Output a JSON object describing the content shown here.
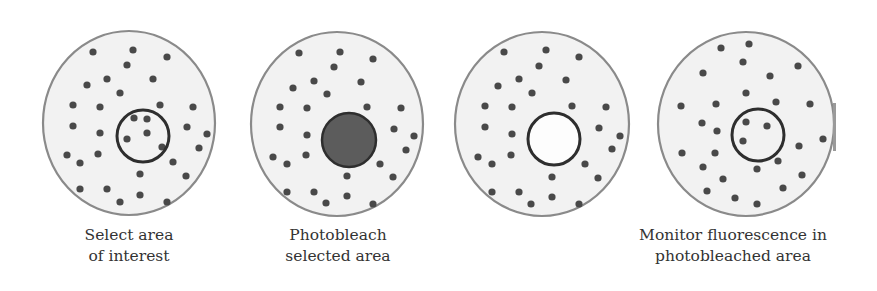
{
  "colors": {
    "cell_fill": "#f2f2f2",
    "cell_stroke": "#8a8a8a",
    "dot": "#4a4a4a",
    "roi_stroke": "#2e2e2e",
    "bleached_fill": "#5c5c5c",
    "label_text": "#333333"
  },
  "panels": [
    {
      "id": "select",
      "cell": {
        "cx": 129,
        "cy": 123,
        "rx": 86,
        "ry": 92
      },
      "roi": {
        "cx": 143,
        "cy": 136,
        "r": 26,
        "state": "outline"
      },
      "label": {
        "line1": "Select area",
        "line2": "of interest",
        "x": 129
      },
      "dots": [
        [
          93,
          52
        ],
        [
          133,
          50
        ],
        [
          167,
          57
        ],
        [
          127,
          65
        ],
        [
          107,
          79
        ],
        [
          87,
          85
        ],
        [
          153,
          79
        ],
        [
          120,
          93
        ],
        [
          73,
          105
        ],
        [
          100,
          107
        ],
        [
          160,
          105
        ],
        [
          193,
          107
        ],
        [
          73,
          126
        ],
        [
          100,
          133
        ],
        [
          187,
          127
        ],
        [
          207,
          134
        ],
        [
          67,
          155
        ],
        [
          80,
          163
        ],
        [
          98,
          154
        ],
        [
          199,
          148
        ],
        [
          173,
          162
        ],
        [
          140,
          174
        ],
        [
          186,
          176
        ],
        [
          80,
          189
        ],
        [
          107,
          189
        ],
        [
          140,
          195
        ],
        [
          120,
          202
        ],
        [
          167,
          202
        ],
        [
          134,
          118
        ],
        [
          147,
          119
        ],
        [
          147,
          133
        ],
        [
          127,
          139
        ],
        [
          162,
          147
        ]
      ]
    },
    {
      "id": "photobleach",
      "cell": {
        "cx": 337,
        "cy": 124,
        "rx": 86,
        "ry": 92
      },
      "roi": {
        "cx": 349,
        "cy": 140,
        "r": 27,
        "state": "filled"
      },
      "label": {
        "line1": "Photobleach",
        "line2": "selected area",
        "x": 338
      },
      "dots": [
        [
          299,
          53
        ],
        [
          340,
          52
        ],
        [
          373,
          59
        ],
        [
          334,
          67
        ],
        [
          314,
          81
        ],
        [
          293,
          88
        ],
        [
          361,
          82
        ],
        [
          327,
          94
        ],
        [
          280,
          107
        ],
        [
          307,
          108
        ],
        [
          367,
          107
        ],
        [
          401,
          108
        ],
        [
          280,
          127
        ],
        [
          307,
          135
        ],
        [
          394,
          129
        ],
        [
          414,
          136
        ],
        [
          273,
          157
        ],
        [
          287,
          164
        ],
        [
          306,
          155
        ],
        [
          406,
          150
        ],
        [
          380,
          164
        ],
        [
          347,
          176
        ],
        [
          393,
          177
        ],
        [
          287,
          192
        ],
        [
          314,
          192
        ],
        [
          347,
          196
        ],
        [
          326,
          203
        ],
        [
          373,
          204
        ]
      ]
    },
    {
      "id": "bleached",
      "cell": {
        "cx": 542,
        "cy": 124,
        "rx": 87,
        "ry": 92
      },
      "roi": {
        "cx": 554,
        "cy": 139,
        "r": 26,
        "state": "empty"
      },
      "label": {
        "line1": "",
        "line2": "",
        "x": 542
      },
      "dots": [
        [
          504,
          52
        ],
        [
          546,
          50
        ],
        [
          579,
          57
        ],
        [
          539,
          66
        ],
        [
          519,
          79
        ],
        [
          498,
          86
        ],
        [
          566,
          80
        ],
        [
          532,
          93
        ],
        [
          485,
          106
        ],
        [
          512,
          107
        ],
        [
          572,
          106
        ],
        [
          606,
          107
        ],
        [
          485,
          127
        ],
        [
          512,
          134
        ],
        [
          599,
          128
        ],
        [
          620,
          136
        ],
        [
          478,
          157
        ],
        [
          492,
          164
        ],
        [
          511,
          155
        ],
        [
          612,
          149
        ],
        [
          585,
          164
        ],
        [
          552,
          177
        ],
        [
          598,
          178
        ],
        [
          492,
          192
        ],
        [
          519,
          192
        ],
        [
          552,
          197
        ],
        [
          531,
          204
        ],
        [
          579,
          204
        ]
      ]
    },
    {
      "id": "monitor",
      "cell": {
        "cx": 746,
        "cy": 124,
        "rx": 88,
        "ry": 92
      },
      "roi": {
        "cx": 758,
        "cy": 135,
        "r": 26,
        "state": "outline"
      },
      "label": {
        "line1": "Monitor fluorescence in",
        "line2": "photobleached area",
        "x": 733
      },
      "dots": [
        [
          721,
          48
        ],
        [
          749,
          44
        ],
        [
          743,
          62
        ],
        [
          798,
          66
        ],
        [
          703,
          73
        ],
        [
          770,
          76
        ],
        [
          746,
          93
        ],
        [
          681,
          106
        ],
        [
          716,
          104
        ],
        [
          776,
          102
        ],
        [
          810,
          104
        ],
        [
          702,
          123
        ],
        [
          717,
          131
        ],
        [
          823,
          139
        ],
        [
          799,
          146
        ],
        [
          682,
          153
        ],
        [
          715,
          153
        ],
        [
          703,
          167
        ],
        [
          778,
          161
        ],
        [
          757,
          169
        ],
        [
          723,
          179
        ],
        [
          802,
          175
        ],
        [
          707,
          191
        ],
        [
          783,
          188
        ],
        [
          735,
          198
        ],
        [
          757,
          204
        ],
        [
          746,
          122
        ],
        [
          767,
          126
        ],
        [
          743,
          141
        ]
      ]
    }
  ],
  "labels": {
    "select_line1": "Select area",
    "select_line2": "of interest",
    "photobleach_line1": "Photobleach",
    "photobleach_line2": "selected area",
    "monitor_line1": "Monitor fluorescence in",
    "monitor_line2": "photobleached area"
  }
}
